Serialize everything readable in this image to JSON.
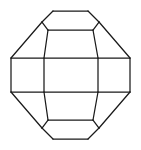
{
  "figure": {
    "title": "Polyhedron Wireframe",
    "kind": "line-drawing",
    "background_color": "#ffffff",
    "stroke_color": "#1a1a1a",
    "stroke_width": 1.25,
    "canvas": {
      "width": 141,
      "height": 150
    },
    "vertices": {
      "top_edge_left": [
        53,
        11
      ],
      "top_edge_right": [
        88,
        11
      ],
      "top_left_shoulder": [
        42,
        22
      ],
      "top_right_shoulder": [
        99,
        22
      ],
      "upper_band_left": [
        48,
        30
      ],
      "upper_band_right": [
        93,
        30
      ],
      "mid_top_far_left": [
        11,
        58
      ],
      "mid_top_left": [
        44,
        58
      ],
      "mid_top_right": [
        98,
        58
      ],
      "mid_top_far_right": [
        130,
        58
      ],
      "mid_bot_far_left": [
        11,
        92
      ],
      "mid_bot_left": [
        44,
        92
      ],
      "mid_bot_right": [
        98,
        92
      ],
      "mid_bot_far_right": [
        130,
        92
      ],
      "lower_band_left": [
        48,
        120
      ],
      "lower_band_right": [
        93,
        120
      ],
      "bottom_left_shoulder": [
        42,
        128
      ],
      "bottom_right_shoulder": [
        99,
        128
      ],
      "bottom_edge_left": [
        53,
        139
      ],
      "bottom_edge_right": [
        88,
        139
      ]
    },
    "edges": [
      {
        "name": "top-face-edge",
        "path": "M 53 11 L 88 11"
      },
      {
        "name": "top-left-bevel",
        "path": "M 53 11 L 42 22"
      },
      {
        "name": "top-right-bevel",
        "path": "M 88 11 L 99 22"
      },
      {
        "name": "upper-left-short-bevel",
        "path": "M 42 22 L 48 30"
      },
      {
        "name": "upper-right-short-bevel",
        "path": "M 99 22 L 93 30"
      },
      {
        "name": "upper-band-edge",
        "path": "M 48 30 L 93 30"
      },
      {
        "name": "upper-left-long-diagonal",
        "path": "M 42 22 L 11 58"
      },
      {
        "name": "upper-right-long-diagonal",
        "path": "M 99 22 L 130 58"
      },
      {
        "name": "upper-left-inner-post",
        "path": "M 48 30 L 44 58"
      },
      {
        "name": "upper-right-inner-post",
        "path": "M 93 30 L 98 58"
      },
      {
        "name": "band-top-rail",
        "path": "M 11 58 L 130 58"
      },
      {
        "name": "band-bottom-rail",
        "path": "M 11 92 L 130 92"
      },
      {
        "name": "band-left-post",
        "path": "M 11 58 L 11 92"
      },
      {
        "name": "band-inner-left-post",
        "path": "M 44 58 L 44 92"
      },
      {
        "name": "band-inner-right-post",
        "path": "M 98 58 L 98 92"
      },
      {
        "name": "band-right-post",
        "path": "M 130 58 L 130 92"
      },
      {
        "name": "lower-left-long-diagonal",
        "path": "M 11 92 L 42 128"
      },
      {
        "name": "lower-right-long-diagonal",
        "path": "M 130 92 L 99 128"
      },
      {
        "name": "lower-left-inner-post",
        "path": "M 44 92 L 48 120"
      },
      {
        "name": "lower-right-inner-post",
        "path": "M 98 92 L 93 120"
      },
      {
        "name": "lower-band-edge",
        "path": "M 48 120 L 93 120"
      },
      {
        "name": "lower-left-short-bevel",
        "path": "M 48 120 L 42 128"
      },
      {
        "name": "lower-right-short-bevel",
        "path": "M 93 120 L 99 128"
      },
      {
        "name": "bottom-left-bevel",
        "path": "M 42 128 L 53 139"
      },
      {
        "name": "bottom-right-bevel",
        "path": "M 99 128 L 88 139"
      },
      {
        "name": "bottom-face-edge",
        "path": "M 53 139 L 88 139"
      }
    ]
  }
}
